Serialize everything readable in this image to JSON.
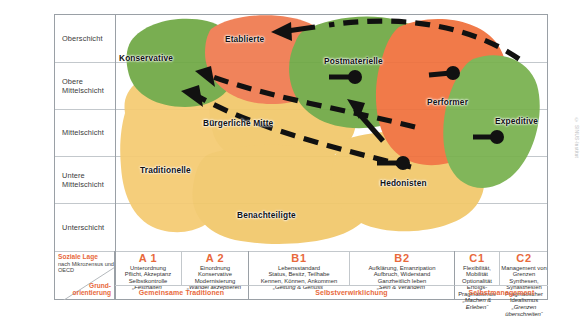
{
  "y_axis": {
    "label_top": "Soziale Lage",
    "label_sub": "nach Mikrozensus und OECD",
    "rows": [
      {
        "id": "oberschicht",
        "label": "Oberschicht"
      },
      {
        "id": "obere-mittelschicht",
        "label": "Obere\nMittelschicht"
      },
      {
        "id": "mittelschicht",
        "label": "Mittelschicht"
      },
      {
        "id": "untere-mittelschicht",
        "label": "Untere\nMittelschicht"
      },
      {
        "id": "unterschicht",
        "label": "Unterschicht"
      }
    ]
  },
  "x_axis": {
    "label": "Grund-\norientierung",
    "columns": [
      {
        "code": "A 1",
        "lines": [
          "Unterordnung",
          "Pflicht, Akzeptanz",
          "Selbstkontrolle"
        ],
        "motto": "„Festhalten“"
      },
      {
        "code": "A 2",
        "lines": [
          "Einordnung",
          "Konservative",
          "Modernisierung"
        ],
        "motto": "„Wandel akzeptieren“"
      },
      {
        "code": "B1",
        "lines": [
          "Lebensstandard",
          "Status, Besitz, Teilhabe",
          "Kennen, Können, Ankommen"
        ],
        "motto": "„Geltung & Genuss“"
      },
      {
        "code": "B2",
        "lines": [
          "Aufklärung, Emanzipation",
          "Aufbruch, Widerstand",
          "Ganzheitlich leben"
        ],
        "motto": "„Sein & Verändern“"
      },
      {
        "code": "C1",
        "lines": [
          "Flexibilität, Mobilität",
          "Optionalität",
          "Erfolgs-Pragmatismus"
        ],
        "motto": "„Machen & Erleben“"
      },
      {
        "code": "C2",
        "lines": [
          "Management von Grenzen",
          "Synthesen, Synästhesien",
          "Pragmatischer Idealismus"
        ],
        "motto": "„Grenzen überschreiten“"
      }
    ],
    "groups": [
      {
        "label": "Gemeinsame Traditionen"
      },
      {
        "label": "Selbstverwirklichung"
      },
      {
        "label": "Selbstmanagement"
      }
    ]
  },
  "milieus": [
    {
      "name": "Konservative",
      "color": "#6fa844",
      "group": "traditional"
    },
    {
      "name": "Etablierte",
      "color": "#ef7a4f",
      "group": "status"
    },
    {
      "name": "Postmaterielle",
      "color": "#6fa844",
      "group": "self"
    },
    {
      "name": "Performer",
      "color": "#f0703c",
      "group": "status"
    },
    {
      "name": "Expeditive",
      "color": "#78b14e",
      "group": "self"
    },
    {
      "name": "Bürgerliche Mitte",
      "color": "#f2c86a",
      "group": "mainstream"
    },
    {
      "name": "Traditionelle",
      "color": "#f5cb72",
      "group": "traditional"
    },
    {
      "name": "Benachteiligte",
      "color": "#f2c86a",
      "group": "mainstream"
    },
    {
      "name": "Hedonisten",
      "color": "#f2c86a",
      "group": "mainstream"
    }
  ],
  "colors": {
    "green": "#6fa844",
    "orange": "#ef7a4f",
    "orange_bright": "#f0703c",
    "yellow": "#f2c86a",
    "yellow_light": "#f5cb72",
    "accent": "#e8693c",
    "grid": "#c3c8cc",
    "frame": "#9aa0a6",
    "arrow": "#111111"
  },
  "credit": "© SINUS-Institut"
}
